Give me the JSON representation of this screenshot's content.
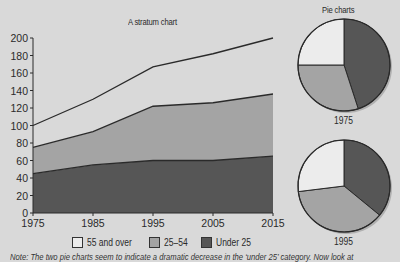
{
  "chart_data": [
    {
      "type": "area",
      "stacked": true,
      "title": "A stratum chart",
      "xlabel": "",
      "ylabel": "",
      "x": [
        1975,
        1985,
        1995,
        2005,
        2015
      ],
      "xticks": [
        "1975",
        "1985",
        "1995",
        "2005",
        "2015"
      ],
      "yticks": [
        "0",
        "20",
        "40",
        "60",
        "80",
        "100",
        "120",
        "140",
        "160",
        "180",
        "200"
      ],
      "ylim": [
        0,
        200
      ],
      "grid": false,
      "series": [
        {
          "name": "Under 25",
          "values": [
            45,
            55,
            60,
            60,
            65
          ],
          "color": "#565656"
        },
        {
          "name": "25–54",
          "values": [
            30,
            38,
            62,
            66,
            71
          ],
          "color": "#a4a4a4"
        },
        {
          "name": "55 and over",
          "values": [
            25,
            37,
            45,
            56,
            64
          ],
          "color": "#ececec"
        }
      ],
      "cumulative_tops": {
        "Under 25": [
          45,
          55,
          60,
          60,
          65
        ],
        "25–54": [
          75,
          93,
          122,
          126,
          136
        ],
        "55 and over": [
          100,
          130,
          167,
          182,
          200
        ]
      },
      "legend_position": "bottom"
    },
    {
      "type": "pie",
      "title": "Pie charts",
      "label": "1975",
      "categories": [
        "Under 25",
        "25–54",
        "55 and over"
      ],
      "values": [
        45,
        30,
        25
      ]
    },
    {
      "type": "pie",
      "title": "Pie charts",
      "label": "1995",
      "categories": [
        "Under 25",
        "25–54",
        "55 and over"
      ],
      "values": [
        60,
        62,
        45
      ]
    }
  ],
  "main_title": "A stratum chart",
  "pie_title": "Pie charts",
  "pie_years": [
    "1975",
    "1995"
  ],
  "legend": [
    {
      "label": "55 and over",
      "color": "#ececec"
    },
    {
      "label": "25–54",
      "color": "#a4a4a4"
    },
    {
      "label": "Under 25",
      "color": "#565656"
    }
  ],
  "note": "Note: The two pie charts seem to indicate a dramatic decrease in the ‘under 25’ category. Now look at",
  "colors": {
    "background": "#d9d9d9",
    "line": "#2a2a2a"
  }
}
